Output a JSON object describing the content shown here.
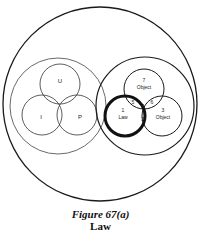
{
  "figure": {
    "title": "Figure 67(a)",
    "subtitle": "Law"
  },
  "diagram": {
    "outer_circle": {
      "cx": 100,
      "cy": 104,
      "r": 97
    },
    "left_group": {
      "enclosure": {
        "cx": 58,
        "cy": 106,
        "r": 48
      },
      "circles": [
        {
          "label": "U",
          "cx": 60,
          "cy": 84,
          "r": 20
        },
        {
          "label": "I",
          "cx": 42,
          "cy": 115,
          "r": 20
        },
        {
          "label": "P",
          "cx": 77,
          "cy": 115,
          "r": 20
        }
      ]
    },
    "right_group": {
      "enclosure": {
        "cx": 145,
        "cy": 106,
        "r": 49
      },
      "circles": [
        {
          "number": "7",
          "label": "Object",
          "cx": 144,
          "cy": 89,
          "r": 20
        },
        {
          "number": "1",
          "label": "Law",
          "cx": 125,
          "cy": 116,
          "r": 20,
          "emphasis": "thick"
        },
        {
          "number": "3",
          "label": "Object",
          "cx": 162,
          "cy": 116,
          "r": 20
        }
      ],
      "region_labels": [
        {
          "text": "5",
          "x": 133,
          "y": 102
        },
        {
          "text": "4",
          "x": 142,
          "y": 106
        },
        {
          "text": "6",
          "x": 152,
          "y": 102
        },
        {
          "text": "2",
          "x": 142,
          "y": 120
        }
      ]
    }
  },
  "labels": {
    "U": "U",
    "I": "I",
    "P": "P",
    "n7": "7",
    "obj7": "Object",
    "n1": "1",
    "law": "Law",
    "n3": "3",
    "obj3": "Object",
    "r5": "5",
    "r4": "4",
    "r6": "6",
    "r2": "2"
  }
}
